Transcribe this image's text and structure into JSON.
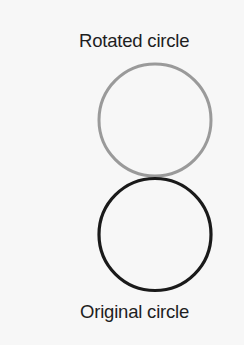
{
  "labels": {
    "rotated": "Rotated circle",
    "original": "Original circle"
  },
  "circles": {
    "rotated": {
      "cx": 155,
      "cy": 120,
      "r": 56,
      "stroke": "#9a9a9a",
      "stroke_width": 3
    },
    "original": {
      "cx": 155,
      "cy": 234.5,
      "r": 56,
      "stroke": "#1a1a1a",
      "stroke_width": 3.2
    }
  }
}
